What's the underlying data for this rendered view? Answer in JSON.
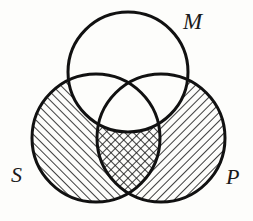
{
  "figure": {
    "kind": "venn-diagram",
    "background_color": "#fdfdfb",
    "stroke_color": "#111111",
    "hatch_color": "#1a1a1a",
    "stroke_width": 3,
    "hatch_line_width": 1.6,
    "hatch_spacing": 6
  },
  "labels": {
    "middle": "M",
    "subject": "S",
    "predicate": "P"
  },
  "circles": [
    {
      "id": "M",
      "label": "M",
      "cx": 128,
      "cy": 72,
      "r": 60,
      "fill": "none",
      "label_x": 190,
      "label_y": 26
    },
    {
      "id": "S",
      "label": "S",
      "cx": 96,
      "cy": 138,
      "r": 64,
      "fill": "hatch-right",
      "label_x": 18,
      "label_y": 179
    },
    {
      "id": "P",
      "label": "P",
      "cx": 161,
      "cy": 138,
      "r": 64,
      "fill": "hatch-left",
      "label_x": 232,
      "label_y": 181
    }
  ],
  "regions": [
    {
      "id": "S-only",
      "description": "S outside M and outside P",
      "shading": "hatch-right"
    },
    {
      "id": "P-only",
      "description": "P outside M and outside S",
      "shading": "hatch-left"
    },
    {
      "id": "S-and-P",
      "description": "S intersect P, outside M",
      "shading": "cross-hatch"
    },
    {
      "id": "M-only",
      "description": "M outside S and outside P",
      "shading": "none"
    },
    {
      "id": "S-and-M",
      "description": "S intersect M, outside P",
      "shading": "none"
    },
    {
      "id": "M-and-P",
      "description": "M intersect P, outside S",
      "shading": "none"
    },
    {
      "id": "S-and-M-and-P",
      "description": "center: S intersect M intersect P",
      "shading": "none"
    }
  ]
}
